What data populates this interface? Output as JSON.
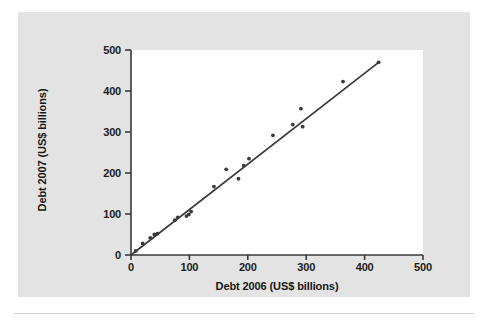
{
  "figure": {
    "background_color": "#e3e3e3",
    "plot_background_color": "#ffffff",
    "ink_color": "#3a3a3a",
    "text_color": "#161616"
  },
  "chart_data": {
    "type": "scatter",
    "title": "",
    "xlabel": "Debt 2006 (US$ billions)",
    "ylabel": "Debt 2007 (US$ billions)",
    "xlim": [
      0,
      500
    ],
    "ylim": [
      0,
      500
    ],
    "xticks": [
      0,
      100,
      200,
      300,
      400,
      500
    ],
    "yticks": [
      0,
      100,
      200,
      300,
      400,
      500
    ],
    "xtick_labels": [
      "0",
      "100",
      "200",
      "300",
      "400",
      "500"
    ],
    "ytick_labels": [
      "0",
      "100",
      "200",
      "300",
      "400",
      "500"
    ],
    "grid": false,
    "legend": null,
    "series": [
      {
        "name": "Countries",
        "marker": "dot",
        "points": [
          [
            8,
            10
          ],
          [
            20,
            28
          ],
          [
            33,
            42
          ],
          [
            40,
            50
          ],
          [
            45,
            52
          ],
          [
            75,
            85
          ],
          [
            80,
            92
          ],
          [
            95,
            95
          ],
          [
            99,
            99
          ],
          [
            103,
            106
          ],
          [
            142,
            167
          ],
          [
            163,
            209
          ],
          [
            184,
            186
          ],
          [
            193,
            218
          ],
          [
            202,
            235
          ],
          [
            243,
            292
          ],
          [
            277,
            318
          ],
          [
            291,
            357
          ],
          [
            294,
            313
          ],
          [
            363,
            423
          ],
          [
            424,
            470
          ]
        ]
      }
    ],
    "trendline": {
      "name": "least-squares line",
      "x_from": 0,
      "y_from": 0,
      "x_to": 424,
      "y_to": 470,
      "slope": 1.108,
      "intercept": 0
    }
  }
}
